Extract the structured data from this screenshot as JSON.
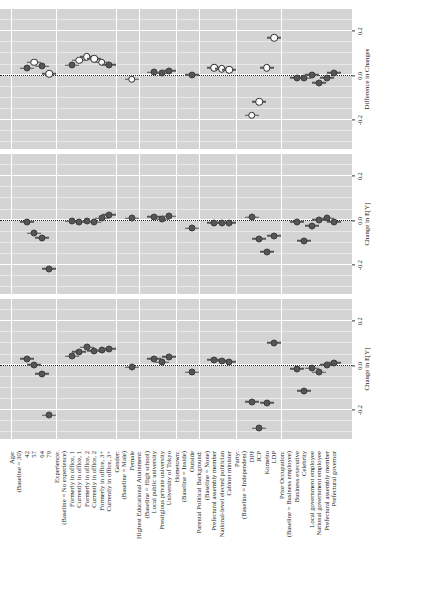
{
  "figure": {
    "type": "coefficient-plot",
    "orientation": "rotated-90-ccw-in-page"
  },
  "rows": [
    {
      "key": "age_head",
      "label": "Age:",
      "type": "header"
    },
    {
      "key": "age_base",
      "label": "(Baseline = 30)",
      "type": "baseline"
    },
    {
      "key": "age_42",
      "label": "42",
      "type": "level"
    },
    {
      "key": "age_57",
      "label": "57",
      "type": "level"
    },
    {
      "key": "age_64",
      "label": "64",
      "type": "level"
    },
    {
      "key": "age_79",
      "label": "79",
      "type": "level"
    },
    {
      "key": "exp_head",
      "label": "Experience:",
      "type": "header"
    },
    {
      "key": "exp_base",
      "label": "(Baseline = No experience)",
      "type": "baseline"
    },
    {
      "key": "exp_f1",
      "label": "Formerly in office, 1",
      "type": "level"
    },
    {
      "key": "exp_c1",
      "label": "Currently in office, 1",
      "type": "level"
    },
    {
      "key": "exp_f2",
      "label": "Formerly in office, 2",
      "type": "level"
    },
    {
      "key": "exp_c2",
      "label": "Currently in office, 2",
      "type": "level"
    },
    {
      "key": "exp_f3",
      "label": "Formerly in office, 3+",
      "type": "level"
    },
    {
      "key": "exp_c3",
      "label": "Currently in office, 3+",
      "type": "level"
    },
    {
      "key": "gen_head",
      "label": "Gender:",
      "type": "header"
    },
    {
      "key": "gen_base",
      "label": "(Baseline = Male)",
      "type": "baseline"
    },
    {
      "key": "gen_f",
      "label": "Female",
      "type": "level"
    },
    {
      "key": "edu_head",
      "label": "Highest Educational Attainment:",
      "type": "header"
    },
    {
      "key": "edu_base",
      "label": "(Baseline = High school)",
      "type": "baseline"
    },
    {
      "key": "edu_lpu",
      "label": "Local public university",
      "type": "level"
    },
    {
      "key": "edu_ppu",
      "label": "Prestigious private university",
      "type": "level"
    },
    {
      "key": "edu_tokyo",
      "label": "University of Tokyo",
      "type": "level"
    },
    {
      "key": "home_head",
      "label": "Hometown:",
      "type": "header"
    },
    {
      "key": "home_base",
      "label": "(Baseline = Inside)",
      "type": "baseline"
    },
    {
      "key": "home_out",
      "label": "Outside",
      "type": "level"
    },
    {
      "key": "par_head",
      "label": "Parental Political Background:",
      "type": "header"
    },
    {
      "key": "par_base",
      "label": "(Baseline = None)",
      "type": "baseline"
    },
    {
      "key": "par_pam",
      "label": "Prefectural assembly member",
      "type": "level"
    },
    {
      "key": "par_nat",
      "label": "National-level elected politician",
      "type": "level"
    },
    {
      "key": "par_cab",
      "label": "Cabinet minister",
      "type": "level"
    },
    {
      "key": "party_head",
      "label": "Party:",
      "type": "header"
    },
    {
      "key": "party_base",
      "label": "(Baseline = Independent)",
      "type": "baseline"
    },
    {
      "key": "party_dpj",
      "label": "DPJ",
      "type": "level"
    },
    {
      "key": "party_jcp",
      "label": "JCP",
      "type": "level"
    },
    {
      "key": "party_kom",
      "label": "Komeito",
      "type": "level"
    },
    {
      "key": "party_ldp",
      "label": "LDP",
      "type": "level"
    },
    {
      "key": "occ_head",
      "label": "Prior Occupation:",
      "type": "header"
    },
    {
      "key": "occ_base",
      "label": "(Baseline = Business employee)",
      "type": "baseline"
    },
    {
      "key": "occ_bex",
      "label": "Business executive",
      "type": "level"
    },
    {
      "key": "occ_cel",
      "label": "Celebrity",
      "type": "level"
    },
    {
      "key": "occ_lge",
      "label": "Local government employee",
      "type": "level"
    },
    {
      "key": "occ_nge",
      "label": "National government employee",
      "type": "level"
    },
    {
      "key": "occ_pam",
      "label": "Prefectural assembly member",
      "type": "level"
    },
    {
      "key": "occ_gov",
      "label": "Prefectural governor",
      "type": "level"
    }
  ],
  "chart_data": {
    "type": "scatter",
    "title": "",
    "xlabel": "",
    "ylabel": "",
    "grid": true,
    "legend": "none",
    "panels": [
      {
        "id": "close-to-ldp",
        "title": "Close to LDP",
        "axis_title": "Change in E[Y]",
        "xlim": [
          -0.33,
          0.3
        ],
        "xticks": [
          -0.2,
          0.0,
          0.2
        ],
        "xticklabels": [
          "-0.2",
          "0.0",
          "0.2"
        ],
        "points": [
          {
            "row": "age_42",
            "est": 0.03,
            "lo": 0.002,
            "hi": 0.058,
            "sig": false
          },
          {
            "row": "age_57",
            "est": 0.004,
            "lo": -0.026,
            "hi": 0.034,
            "sig": false
          },
          {
            "row": "age_64",
            "est": -0.036,
            "lo": -0.064,
            "hi": -0.008,
            "sig": false
          },
          {
            "row": "age_79",
            "est": -0.224,
            "lo": -0.254,
            "hi": -0.194,
            "sig": false
          },
          {
            "row": "exp_f1",
            "est": 0.043,
            "lo": 0.012,
            "hi": 0.074,
            "sig": false
          },
          {
            "row": "exp_c1",
            "est": 0.063,
            "lo": 0.032,
            "hi": 0.094,
            "sig": false
          },
          {
            "row": "exp_f2",
            "est": 0.082,
            "lo": 0.05,
            "hi": 0.114,
            "sig": false
          },
          {
            "row": "exp_c2",
            "est": 0.068,
            "lo": 0.036,
            "hi": 0.1,
            "sig": false
          },
          {
            "row": "exp_f3",
            "est": 0.07,
            "lo": 0.039,
            "hi": 0.101,
            "sig": false
          },
          {
            "row": "exp_c3",
            "est": 0.077,
            "lo": 0.045,
            "hi": 0.109,
            "sig": false
          },
          {
            "row": "gen_f",
            "est": -0.007,
            "lo": -0.028,
            "hi": 0.014,
            "sig": false
          },
          {
            "row": "edu_lpu",
            "est": 0.032,
            "lo": 0.004,
            "hi": 0.06,
            "sig": false
          },
          {
            "row": "edu_ppu",
            "est": 0.016,
            "lo": -0.012,
            "hi": 0.044,
            "sig": false
          },
          {
            "row": "edu_tokyo",
            "est": 0.04,
            "lo": 0.011,
            "hi": 0.069,
            "sig": false
          },
          {
            "row": "home_out",
            "est": -0.029,
            "lo": -0.05,
            "hi": -0.008,
            "sig": false
          },
          {
            "row": "par_pam",
            "est": 0.027,
            "lo": -0.002,
            "hi": 0.056,
            "sig": false
          },
          {
            "row": "par_nat",
            "est": 0.022,
            "lo": -0.007,
            "hi": 0.051,
            "sig": false
          },
          {
            "row": "par_cab",
            "est": 0.017,
            "lo": -0.012,
            "hi": 0.046,
            "sig": false
          },
          {
            "row": "party_dpj",
            "est": -0.162,
            "lo": -0.195,
            "hi": -0.129,
            "sig": false
          },
          {
            "row": "party_jcp",
            "est": -0.281,
            "lo": -0.315,
            "hi": -0.247,
            "sig": false
          },
          {
            "row": "party_kom",
            "est": -0.168,
            "lo": -0.202,
            "hi": -0.134,
            "sig": false
          },
          {
            "row": "party_ldp",
            "est": 0.102,
            "lo": 0.069,
            "hi": 0.135,
            "sig": false
          },
          {
            "row": "occ_bex",
            "est": -0.013,
            "lo": -0.046,
            "hi": 0.02,
            "sig": false
          },
          {
            "row": "occ_cel",
            "est": -0.112,
            "lo": -0.146,
            "hi": -0.078,
            "sig": false
          },
          {
            "row": "occ_lge",
            "est": -0.011,
            "lo": -0.044,
            "hi": 0.022,
            "sig": false
          },
          {
            "row": "occ_nge",
            "est": -0.03,
            "lo": -0.063,
            "hi": 0.003,
            "sig": false
          },
          {
            "row": "occ_pam",
            "est": 0.003,
            "lo": -0.029,
            "hi": 0.035,
            "sig": false
          },
          {
            "row": "occ_gov",
            "est": 0.012,
            "lo": -0.021,
            "hi": 0.045,
            "sig": false
          }
        ]
      },
      {
        "id": "close-to-dpj",
        "title": "Close to DPJ",
        "axis_title": "Change in E[Y]",
        "xlim": [
          -0.33,
          0.3
        ],
        "xticks": [
          -0.2,
          0.0,
          0.2
        ],
        "xticklabels": [
          "-0.2",
          "0.0",
          "0.2"
        ],
        "points": [
          {
            "row": "age_42",
            "est": -0.004,
            "lo": -0.044,
            "hi": 0.036,
            "sig": false
          },
          {
            "row": "age_57",
            "est": -0.056,
            "lo": -0.098,
            "hi": -0.014,
            "sig": false
          },
          {
            "row": "age_64",
            "est": -0.078,
            "lo": -0.12,
            "hi": -0.036,
            "sig": false
          },
          {
            "row": "age_79",
            "est": -0.216,
            "lo": -0.26,
            "hi": -0.172,
            "sig": false
          },
          {
            "row": "exp_f1",
            "est": -0.003,
            "lo": -0.047,
            "hi": 0.041,
            "sig": false
          },
          {
            "row": "exp_c1",
            "est": -0.006,
            "lo": -0.05,
            "hi": 0.038,
            "sig": false
          },
          {
            "row": "exp_f2",
            "est": -0.002,
            "lo": -0.046,
            "hi": 0.042,
            "sig": false
          },
          {
            "row": "exp_c2",
            "est": -0.007,
            "lo": -0.051,
            "hi": 0.037,
            "sig": false
          },
          {
            "row": "exp_f3",
            "est": 0.01,
            "lo": -0.034,
            "hi": 0.054,
            "sig": false
          },
          {
            "row": "exp_c3",
            "est": 0.027,
            "lo": -0.017,
            "hi": 0.071,
            "sig": false
          },
          {
            "row": "gen_f",
            "est": 0.01,
            "lo": -0.02,
            "hi": 0.04,
            "sig": false
          },
          {
            "row": "edu_lpu",
            "est": 0.017,
            "lo": -0.023,
            "hi": 0.057,
            "sig": false
          },
          {
            "row": "edu_ppu",
            "est": 0.006,
            "lo": -0.034,
            "hi": 0.046,
            "sig": false
          },
          {
            "row": "edu_tokyo",
            "est": 0.019,
            "lo": -0.021,
            "hi": 0.059,
            "sig": false
          },
          {
            "row": "home_out",
            "est": -0.034,
            "lo": -0.064,
            "hi": -0.004,
            "sig": false
          },
          {
            "row": "par_pam",
            "est": -0.009,
            "lo": -0.049,
            "hi": 0.031,
            "sig": false
          },
          {
            "row": "par_nat",
            "est": -0.01,
            "lo": -0.05,
            "hi": 0.03,
            "sig": false
          },
          {
            "row": "par_cab",
            "est": -0.009,
            "lo": -0.049,
            "hi": 0.031,
            "sig": false
          },
          {
            "row": "party_dpj",
            "est": 0.016,
            "lo": -0.03,
            "hi": 0.062,
            "sig": false
          },
          {
            "row": "party_jcp",
            "est": -0.082,
            "lo": -0.128,
            "hi": -0.036,
            "sig": false
          },
          {
            "row": "party_kom",
            "est": -0.14,
            "lo": -0.186,
            "hi": -0.094,
            "sig": false
          },
          {
            "row": "party_ldp",
            "est": -0.068,
            "lo": -0.114,
            "hi": -0.022,
            "sig": false
          },
          {
            "row": "occ_bex",
            "est": -0.004,
            "lo": -0.05,
            "hi": 0.042,
            "sig": false
          },
          {
            "row": "occ_cel",
            "est": -0.091,
            "lo": -0.137,
            "hi": -0.045,
            "sig": false
          },
          {
            "row": "occ_lge",
            "est": -0.023,
            "lo": -0.069,
            "hi": 0.023,
            "sig": false
          },
          {
            "row": "occ_nge",
            "est": 0.004,
            "lo": -0.042,
            "hi": 0.05,
            "sig": false
          },
          {
            "row": "occ_pam",
            "est": 0.011,
            "lo": -0.035,
            "hi": 0.057,
            "sig": false
          },
          {
            "row": "occ_gov",
            "est": -0.004,
            "lo": -0.05,
            "hi": 0.042,
            "sig": false
          }
        ]
      },
      {
        "id": "comparison",
        "title": "Comparison",
        "axis_title": "Difference in Changes",
        "xlim": [
          -0.33,
          0.3
        ],
        "xticks": [
          -0.2,
          0.0,
          0.2
        ],
        "xticklabels": [
          "-0.2",
          "0.0",
          "0.2"
        ],
        "points": [
          {
            "row": "age_42",
            "est": 0.034,
            "lo": -0.014,
            "hi": 0.082,
            "sig": false
          },
          {
            "row": "age_57",
            "est": 0.06,
            "lo": 0.01,
            "hi": 0.11,
            "sig": true
          },
          {
            "row": "age_64",
            "est": 0.042,
            "lo": -0.008,
            "hi": 0.092,
            "sig": false
          },
          {
            "row": "age_79",
            "est": 0.008,
            "lo": -0.044,
            "hi": 0.06,
            "sig": true
          },
          {
            "row": "exp_f1",
            "est": 0.046,
            "lo": -0.006,
            "hi": 0.098,
            "sig": false
          },
          {
            "row": "exp_c1",
            "est": 0.069,
            "lo": 0.015,
            "hi": 0.123,
            "sig": true
          },
          {
            "row": "exp_f2",
            "est": 0.084,
            "lo": 0.03,
            "hi": 0.138,
            "sig": true
          },
          {
            "row": "exp_c2",
            "est": 0.075,
            "lo": 0.021,
            "hi": 0.129,
            "sig": true
          },
          {
            "row": "exp_f3",
            "est": 0.06,
            "lo": 0.006,
            "hi": 0.114,
            "sig": true
          },
          {
            "row": "exp_c3",
            "est": 0.05,
            "lo": -0.004,
            "hi": 0.104,
            "sig": false
          },
          {
            "row": "gen_f",
            "est": -0.017,
            "lo": -0.053,
            "hi": 0.019,
            "sig": true
          },
          {
            "row": "edu_lpu",
            "est": 0.015,
            "lo": -0.033,
            "hi": 0.063,
            "sig": false
          },
          {
            "row": "edu_ppu",
            "est": 0.01,
            "lo": -0.038,
            "hi": 0.058,
            "sig": false
          },
          {
            "row": "edu_tokyo",
            "est": 0.021,
            "lo": -0.027,
            "hi": 0.069,
            "sig": false
          },
          {
            "row": "home_out",
            "est": 0.005,
            "lo": -0.031,
            "hi": 0.041,
            "sig": false
          },
          {
            "row": "par_pam",
            "est": 0.036,
            "lo": -0.012,
            "hi": 0.084,
            "sig": true
          },
          {
            "row": "par_nat",
            "est": 0.032,
            "lo": -0.016,
            "hi": 0.08,
            "sig": true
          },
          {
            "row": "par_cab",
            "est": 0.026,
            "lo": -0.022,
            "hi": 0.074,
            "sig": true
          },
          {
            "row": "party_dpj",
            "est": -0.178,
            "lo": -0.234,
            "hi": -0.122,
            "sig": true
          },
          {
            "row": "party_jcp",
            "est": -0.118,
            "lo": -0.174,
            "hi": -0.062,
            "sig": true
          },
          {
            "row": "party_kom",
            "est": 0.036,
            "lo": -0.02,
            "hi": 0.092,
            "sig": true
          },
          {
            "row": "party_ldp",
            "est": 0.17,
            "lo": 0.114,
            "hi": 0.226,
            "sig": true
          },
          {
            "row": "occ_bex",
            "est": -0.009,
            "lo": -0.065,
            "hi": 0.047,
            "sig": false
          },
          {
            "row": "occ_cel",
            "est": -0.012,
            "lo": -0.068,
            "hi": 0.044,
            "sig": false
          },
          {
            "row": "occ_lge",
            "est": 0.003,
            "lo": -0.053,
            "hi": 0.059,
            "sig": false
          },
          {
            "row": "occ_nge",
            "est": -0.032,
            "lo": -0.088,
            "hi": 0.024,
            "sig": false
          },
          {
            "row": "occ_pam",
            "est": -0.01,
            "lo": -0.066,
            "hi": 0.046,
            "sig": false
          },
          {
            "row": "occ_gov",
            "est": 0.012,
            "lo": -0.044,
            "hi": 0.068,
            "sig": false
          }
        ]
      }
    ]
  }
}
